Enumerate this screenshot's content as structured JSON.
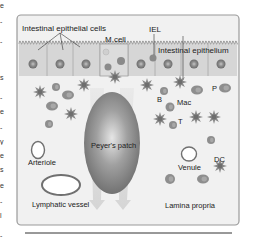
{
  "figure": {
    "labels": {
      "epithelial_cells": "Intestinal epithelial cells",
      "m_cell": "M cell",
      "iel": "IEL",
      "epithelium": "Intestinal epithelium",
      "peyers_patch": "Peyer's patch",
      "b": "B",
      "mac": "Mac",
      "t": "T",
      "p": "P",
      "arteriole": "Arteriole",
      "venule": "Venule",
      "dc": "DC",
      "lymphatic": "Lymphatic vessel",
      "lamina": "Lamina propria"
    },
    "colors": {
      "panel_bg": "#f2f2f2",
      "panel_border": "#9a9a9a",
      "epithelium_fill": "#d4d4d4",
      "nucleus_outer": "#7a7a7a",
      "nucleus_inner": "#b0b0b0",
      "patch_dark": "#6f6f6f",
      "patch_light": "#d8d8d8",
      "cell_gray": "#8c8c8c",
      "arrow_fill": "#dcdcdc"
    }
  },
  "left_edge_fragments": [
    "e",
    "-",
    "-",
    "s",
    "-",
    "e",
    "-",
    "y",
    "e",
    "s",
    "e",
    "-",
    "l",
    "-"
  ]
}
